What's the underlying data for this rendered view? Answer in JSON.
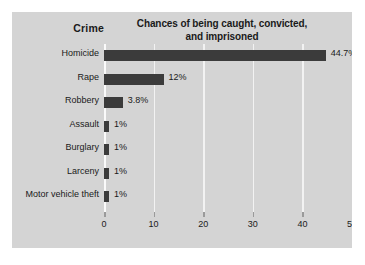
{
  "figure": {
    "column_header": "Crime",
    "title_line1": "Chances of being caught, convicted,",
    "title_line2": "and imprisoned",
    "panel_color": "#d4d4d4",
    "bar_color": "#3b3b3b",
    "gridline_color": "#f2f2f2"
  },
  "chart_data": {
    "type": "bar",
    "orientation": "horizontal",
    "title": "Chances of being caught, convicted, and imprisoned",
    "xlabel": "",
    "ylabel": "Crime",
    "xlim": [
      0,
      50
    ],
    "xticks": [
      0,
      10,
      20,
      30,
      40,
      50
    ],
    "xtick_labels": [
      "0",
      "10",
      "20",
      "30",
      "40",
      "50"
    ],
    "grid": true,
    "legend": false,
    "categories": [
      "Homicide",
      "Rape",
      "Robbery",
      "Assault",
      "Burglary",
      "Larceny",
      "Motor vehicle theft"
    ],
    "values": [
      44.7,
      12,
      3.8,
      1,
      1,
      1,
      1
    ],
    "data_labels": [
      "44.7%",
      "12%",
      "3.8%",
      "1%",
      "1%",
      "1%",
      "1%"
    ]
  }
}
